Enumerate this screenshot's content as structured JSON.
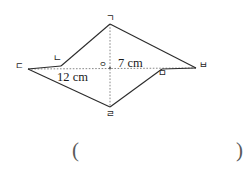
{
  "figure": {
    "type": "quadrilateral-with-diagonals",
    "shape_name": "rhombus",
    "vertices": [
      {
        "id": "g",
        "label": "ㄱ",
        "x": 110,
        "y": 24
      },
      {
        "id": "n",
        "label": "ㄴ",
        "x": 61,
        "y": 67
      },
      {
        "id": "d",
        "label": "ㄷ",
        "x": 28,
        "y": 69
      },
      {
        "id": "r",
        "label": "ㄹ",
        "x": 110,
        "y": 107
      },
      {
        "id": "m",
        "label": "ㅁ",
        "x": 162,
        "y": 68
      },
      {
        "id": "b",
        "label": "ㅂ",
        "x": 196,
        "y": 68
      },
      {
        "id": "o",
        "label": "ㅇ",
        "x": 110,
        "y": 68
      }
    ],
    "dimensions": [
      {
        "id": "vertical-diagonal",
        "value": "7 cm",
        "number": 7,
        "unit": "cm"
      },
      {
        "id": "horizontal-diagonal",
        "value": "12 cm",
        "number": 12,
        "unit": "cm"
      }
    ]
  },
  "answer": {
    "open_paren": "(",
    "close_paren": ")",
    "value": ""
  }
}
